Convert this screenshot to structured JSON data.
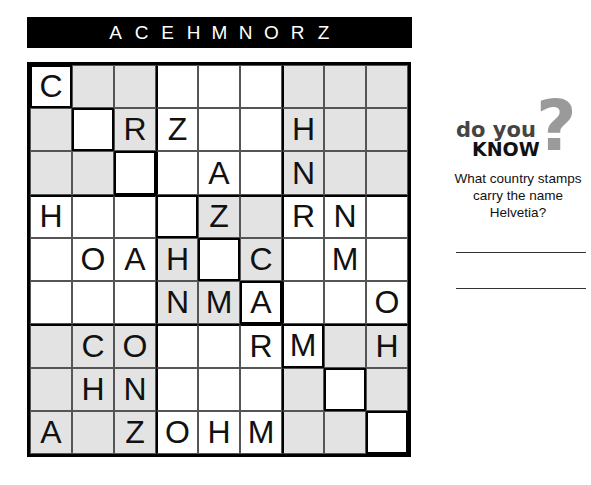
{
  "puzzle": {
    "letters": [
      "A",
      "C",
      "E",
      "H",
      "M",
      "N",
      "O",
      "R",
      "Z"
    ],
    "grid": [
      [
        "C",
        "",
        "",
        "",
        "",
        "",
        "",
        "",
        ""
      ],
      [
        "",
        "",
        "R",
        "Z",
        "",
        "",
        "H",
        "",
        ""
      ],
      [
        "",
        "",
        "",
        "",
        "A",
        "",
        "N",
        "",
        ""
      ],
      [
        "H",
        "",
        "",
        "",
        "Z",
        "",
        "R",
        "N",
        ""
      ],
      [
        "",
        "O",
        "A",
        "H",
        "",
        "C",
        "",
        "M",
        ""
      ],
      [
        "",
        "",
        "",
        "N",
        "M",
        "A",
        "",
        "",
        "O"
      ],
      [
        "",
        "C",
        "O",
        "",
        "",
        "R",
        "M",
        "",
        "H"
      ],
      [
        "",
        "H",
        "N",
        "",
        "",
        "",
        "",
        "",
        ""
      ],
      [
        "A",
        "",
        "Z",
        "O",
        "H",
        "M",
        "",
        "",
        ""
      ]
    ]
  },
  "sidebar": {
    "logo_line1": "do you",
    "logo_line2": "KNOW",
    "logo_mark": "?",
    "question": "What country stamps carry the name Helvetia?"
  }
}
